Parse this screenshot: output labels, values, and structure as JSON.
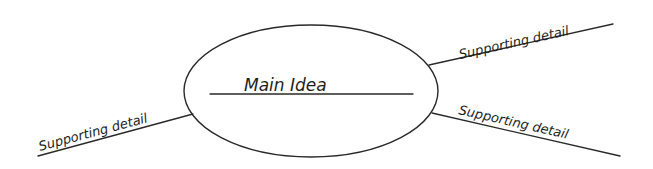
{
  "diagram": {
    "type": "main-idea-organizer",
    "main_idea": {
      "label": "Main Idea"
    },
    "supporting_details": [
      {
        "id": "upper-right",
        "label": "Supporting detail"
      },
      {
        "id": "lower-right",
        "label": "Supporting detail"
      },
      {
        "id": "lower-left",
        "label": "Supporting detail"
      }
    ],
    "colors": {
      "stroke": "#2a2a2a",
      "text": "#1e1e1e",
      "background": "#ffffff"
    }
  }
}
